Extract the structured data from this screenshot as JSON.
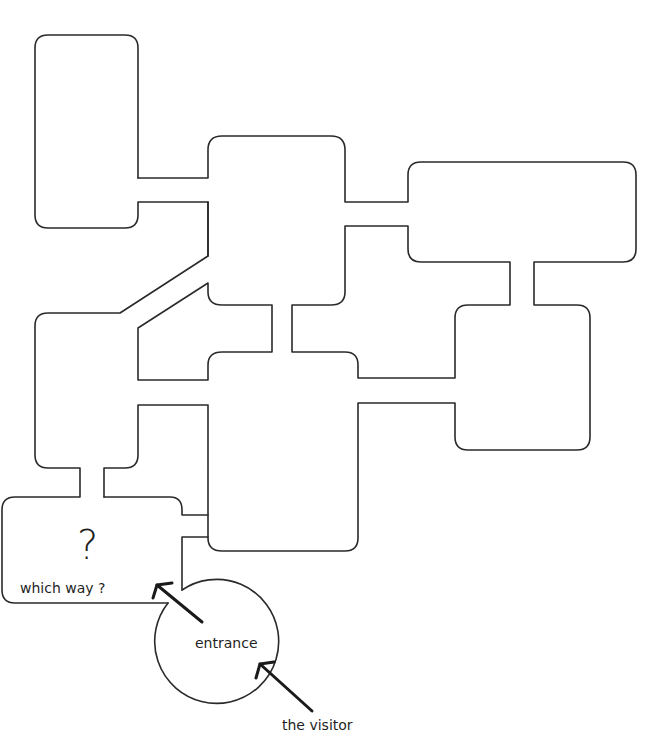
{
  "diagram": {
    "type": "floor-plan-maze",
    "rooms": [
      {
        "id": "room-top-left"
      },
      {
        "id": "room-top-center"
      },
      {
        "id": "room-top-right"
      },
      {
        "id": "room-mid-left"
      },
      {
        "id": "room-mid-center"
      },
      {
        "id": "room-bottom-right"
      },
      {
        "id": "room-bottom-center"
      },
      {
        "id": "room-entry-hall"
      }
    ],
    "colors": {
      "line": "#2a2a2a",
      "background": "#ffffff"
    }
  },
  "labels": {
    "question_mark": "?",
    "which_way": "which way ?",
    "entrance": "entrance",
    "visitor": "the visitor"
  }
}
